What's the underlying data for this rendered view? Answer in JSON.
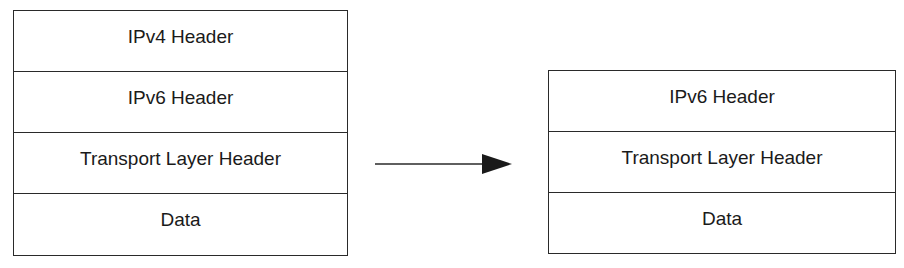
{
  "before": {
    "layers": [
      {
        "label": "IPv4 Header"
      },
      {
        "label": "IPv6 Header"
      },
      {
        "label": "Transport Layer Header"
      },
      {
        "label": "Data"
      }
    ]
  },
  "after": {
    "layers": [
      {
        "label": "IPv6 Header"
      },
      {
        "label": "Transport Layer Header"
      },
      {
        "label": "Data"
      }
    ]
  },
  "arrow": {
    "icon": "right-arrow-icon",
    "color": "#1a1a1a"
  }
}
